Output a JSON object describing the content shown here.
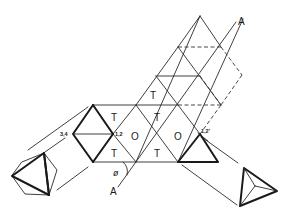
{
  "figure": {
    "stroke_color": "#1a1a1a",
    "background": "#ffffff"
  },
  "labels": {
    "face_T": "T",
    "face_O": "O",
    "axis_top": "A",
    "axis_bottom": "A",
    "angle": "ø",
    "vertex_left": "3,4",
    "vertex_center": "1,2",
    "vertex_right": "1,2'"
  },
  "faces": [
    {
      "label": "T",
      "x": 156,
      "y": 98
    },
    {
      "label": "T",
      "x": 114,
      "y": 119
    },
    {
      "label": "T",
      "x": 156,
      "y": 119
    },
    {
      "label": "O",
      "x": 134,
      "y": 140
    },
    {
      "label": "O",
      "x": 178,
      "y": 140
    },
    {
      "label": "T",
      "x": 114,
      "y": 156
    },
    {
      "label": "T",
      "x": 156,
      "y": 156
    }
  ],
  "solids": [
    {
      "name": "octahedron-projection",
      "position": "lower-left"
    },
    {
      "name": "tetrahedron-projection",
      "position": "lower-right"
    }
  ]
}
